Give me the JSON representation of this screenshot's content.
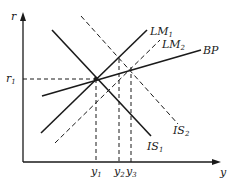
{
  "diagram": {
    "type": "IS-LM-BP",
    "axes": {
      "y_axis_label": "r",
      "x_axis_label": "y"
    },
    "y_ticks": [
      {
        "base": "r",
        "sub": "1"
      }
    ],
    "x_ticks": [
      {
        "base": "y",
        "sub": "1"
      },
      {
        "base": "y",
        "sub": "2"
      },
      {
        "base": "y",
        "sub": "3"
      }
    ],
    "curves": [
      {
        "id": "IS1",
        "base": "IS",
        "sub": "1",
        "style": "solid"
      },
      {
        "id": "IS2",
        "base": "IS",
        "sub": "2",
        "style": "dashed"
      },
      {
        "id": "LM1",
        "base": "LM",
        "sub": "1",
        "style": "solid"
      },
      {
        "id": "LM2",
        "base": "LM",
        "sub": "2",
        "style": "dashed"
      },
      {
        "id": "BP",
        "base": "BP",
        "sub": "",
        "style": "solid"
      }
    ],
    "colors": {
      "line": "#1a1a1a",
      "background": "#ffffff"
    }
  }
}
